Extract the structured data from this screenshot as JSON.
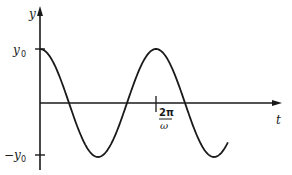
{
  "chart_data": {
    "type": "line",
    "title": "",
    "xlabel": "t",
    "ylabel": "y",
    "function": "y = y0 cos(ωt)",
    "x_ticks": [
      {
        "label": "2π/ω",
        "value": "2π/ω"
      }
    ],
    "y_ticks": [
      {
        "label": "y0",
        "value": 1
      },
      {
        "label": "-y0",
        "value": -1
      }
    ],
    "grid": false,
    "legend": null,
    "series": [
      {
        "name": "y(t)",
        "x_in_periods": [
          0,
          0.125,
          0.25,
          0.375,
          0.5,
          0.625,
          0.75,
          0.875,
          1.0,
          1.125,
          1.25,
          1.375
        ],
        "y_normalized": [
          1,
          0.707,
          0,
          -0.707,
          -1,
          -0.707,
          0,
          0.707,
          1,
          0.707,
          0,
          -0.6
        ]
      }
    ],
    "ylim": [
      -1.15,
      1.9
    ],
    "xlim_periods": [
      0,
      2.05
    ]
  },
  "labels": {
    "y_axis": "y",
    "t_axis": "t",
    "y0_label": "y",
    "y0_sub": "0",
    "neg_y0_prefix": "−y",
    "neg_y0_sub": "0",
    "period_num": "2π",
    "period_den": "ω"
  }
}
